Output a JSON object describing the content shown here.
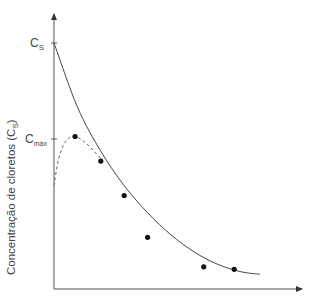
{
  "chart_data": {
    "type": "line",
    "title": "",
    "xlabel": "",
    "ylabel": "Concentração de cloretos (Cs)",
    "ylabel_main": "Concentração de cloretos (C",
    "ylabel_sub": "S",
    "ylabel_close": ")",
    "y_ticks": [
      {
        "label": "C",
        "sub": "S",
        "value": 1.0
      },
      {
        "label": "C",
        "sub": "máx",
        "value": 0.62
      }
    ],
    "xlim": [
      0,
      1
    ],
    "ylim": [
      0,
      1.16
    ],
    "grid": false,
    "series": [
      {
        "name": "fitted-curve",
        "style": "solid",
        "x": [
          0.0,
          0.1,
          0.2,
          0.3,
          0.4,
          0.5,
          0.6,
          0.7,
          0.8,
          0.88
        ],
        "y": [
          1.0,
          0.74,
          0.56,
          0.42,
          0.31,
          0.22,
          0.15,
          0.1,
          0.07,
          0.06
        ]
      },
      {
        "name": "measured-profile",
        "style": "dashed",
        "x": [
          0.0,
          0.02,
          0.05,
          0.09,
          0.14,
          0.2
        ],
        "y": [
          0.42,
          0.53,
          0.6,
          0.62,
          0.59,
          0.53
        ]
      },
      {
        "name": "data-points",
        "style": "markers",
        "x": [
          0.09,
          0.2,
          0.3,
          0.4,
          0.64,
          0.77
        ],
        "y": [
          0.62,
          0.52,
          0.38,
          0.21,
          0.09,
          0.08
        ]
      }
    ]
  }
}
